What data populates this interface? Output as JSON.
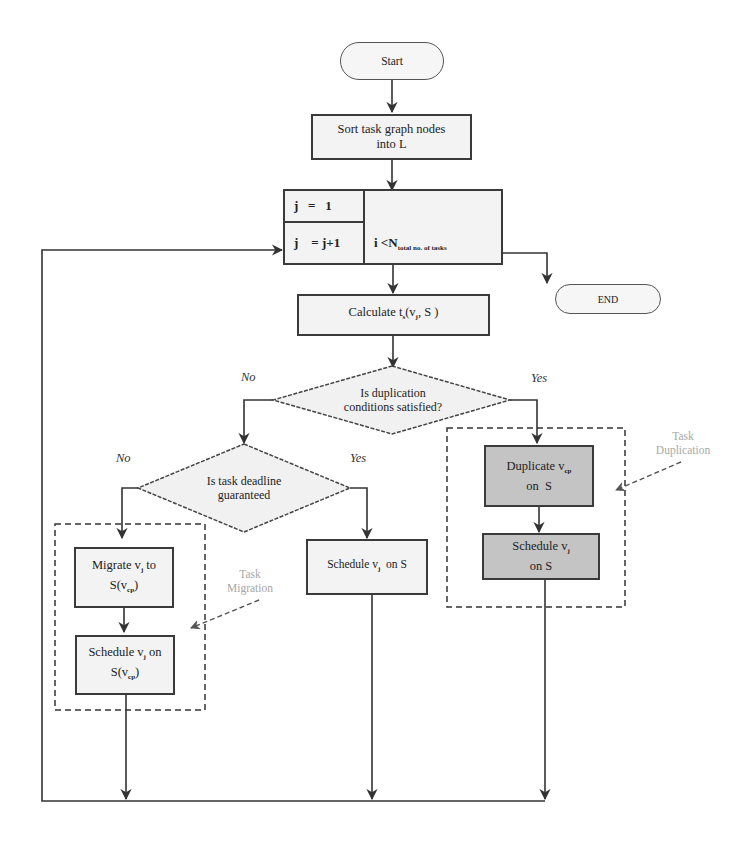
{
  "diagram": {
    "type": "flowchart",
    "colors": {
      "line": "#333333",
      "box_fill": "#f3f3f3",
      "highlight_fill": "#c4c4c4",
      "annotation_text": "#a8a8a8"
    },
    "nodes": {
      "start": {
        "label": "Start"
      },
      "sort": {
        "line1": "Sort task graph nodes",
        "line2": "into L"
      },
      "loop": {
        "init": "j   =   1",
        "increment": "j    = j+1",
        "condition_prefix": "i <N",
        "condition_sub": "total no. of tasks"
      },
      "end": {
        "label": "END"
      },
      "calculate": {
        "label": "Calculate t",
        "sub": "s",
        "suffix": "(v",
        "sub2": "j",
        "suffix2": ", S )"
      },
      "dup_decision": {
        "line1": "Is duplication",
        "line2": "conditions satisfied?"
      },
      "deadline_decision": {
        "line1": "Is task deadline",
        "line2": "guaranteed"
      },
      "duplicate": {
        "line1_prefix": "Duplicate v",
        "line1_sub": "cp",
        "line2": "on  S"
      },
      "schedule_dup": {
        "line1_prefix": "Schedule v",
        "line1_sub": "j",
        "line2": "on S"
      },
      "schedule_direct": {
        "prefix": "Schedule v",
        "sub": "j",
        "suffix": "  on S"
      },
      "migrate": {
        "line1_prefix": "Migrate v",
        "line1_sub": "j",
        "line1_suffix": " to",
        "line2_prefix": "S(v",
        "line2_sub": "cp",
        "line2_suffix": ")"
      },
      "schedule_migrate": {
        "line1_prefix": "Schedule v",
        "line1_sub": "j",
        "line1_suffix": " on",
        "line2_prefix": "S(v",
        "line2_sub": "cp",
        "line2_suffix": ")"
      }
    },
    "edge_labels": {
      "dup_no": "No",
      "dup_yes": "Yes",
      "deadline_no": "No",
      "deadline_yes": "Yes"
    },
    "groups": {
      "duplication": {
        "line1": "Task",
        "line2": "Duplication"
      },
      "migration": {
        "line1": "Task",
        "line2": "Migration"
      }
    }
  }
}
